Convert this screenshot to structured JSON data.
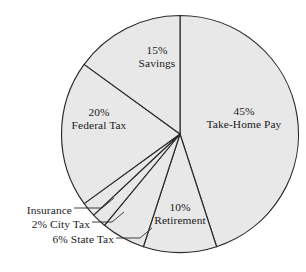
{
  "chart_data": {
    "type": "pie",
    "title": "",
    "subtitle": "",
    "xlabel": "",
    "ylabel": "",
    "legend_position": "none",
    "grid": false,
    "start_angle_deg": 0,
    "direction": "clockwise",
    "units": "percent",
    "total": 100,
    "categories": [
      "Take-Home Pay",
      "Retirement",
      "State Tax",
      "City Tax",
      "Insurance",
      "Federal Tax",
      "Savings"
    ],
    "values": [
      45,
      10,
      6,
      2,
      2,
      20,
      15
    ],
    "slices": [
      {
        "name": "Take-Home Pay",
        "value": 45,
        "percent_text": "45%",
        "label_text": "Take-Home Pay",
        "label_placement": "inside",
        "fill": "#e8e8e8"
      },
      {
        "name": "Retirement",
        "value": 10,
        "percent_text": "10%",
        "label_text": "Retirement",
        "label_placement": "inside",
        "fill": "#e8e8e8"
      },
      {
        "name": "State Tax",
        "value": 6,
        "percent_text": "6%",
        "label_text": "6% State Tax",
        "label_placement": "outside",
        "fill": "#e8e8e8"
      },
      {
        "name": "City Tax",
        "value": 2,
        "percent_text": "2%",
        "label_text": "2% City Tax",
        "label_placement": "outside",
        "fill": "#e8e8e8"
      },
      {
        "name": "Insurance",
        "value": 2,
        "percent_text": "",
        "label_text": "Insurance",
        "label_placement": "outside",
        "fill": "#e8e8e8"
      },
      {
        "name": "Federal Tax",
        "value": 20,
        "percent_text": "20%",
        "label_text": "Federal Tax",
        "label_placement": "inside",
        "fill": "#e8e8e8"
      },
      {
        "name": "Savings",
        "value": 15,
        "percent_text": "15%",
        "label_text": "Savings",
        "label_placement": "inside",
        "fill": "#e8e8e8"
      }
    ]
  },
  "labels": {
    "takehome": {
      "pct": "45%",
      "name": "Take-Home Pay"
    },
    "savings": {
      "pct": "15%",
      "name": "Savings"
    },
    "federal": {
      "pct": "20%",
      "name": "Federal Tax"
    },
    "retirement": {
      "pct": "10%",
      "name": "Retirement"
    },
    "insurance": {
      "text": "Insurance"
    },
    "citytax": {
      "text": "2% City Tax"
    },
    "statetax": {
      "text": "6% State Tax"
    }
  },
  "style": {
    "slice_fill": "#e8e8e8",
    "outline": "#2a2a2a",
    "background": "#ffffff",
    "text_color": "#1a1a1a"
  }
}
